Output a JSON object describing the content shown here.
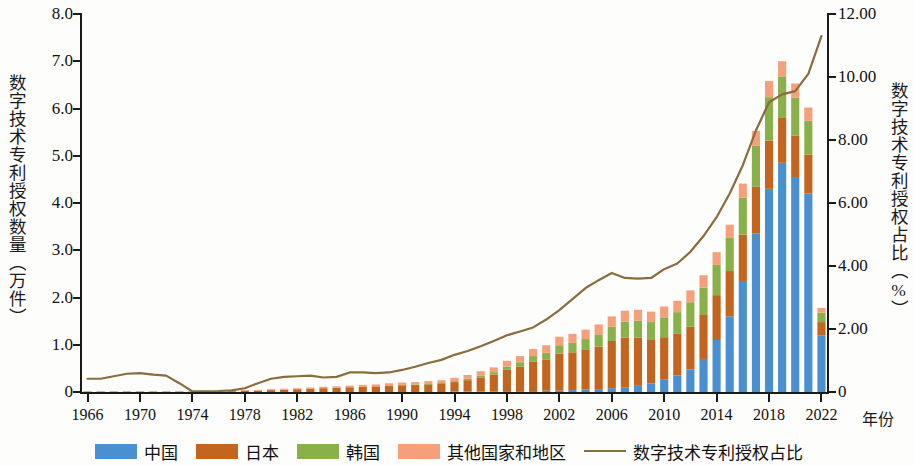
{
  "axes": {
    "y_left_title": "数字技术专利授权数量（万件）",
    "y_right_title": "数字技术专利授权占比（%）",
    "x_title": "年份",
    "y_left_ticks": [
      "8.0",
      "7.0",
      "6.0",
      "5.0",
      "4.0",
      "3.0",
      "2.0",
      "1.0",
      "0"
    ],
    "y_right_ticks": [
      "12.00",
      "10.00",
      "8.00",
      "6.00",
      "4.00",
      "2.00",
      "0"
    ],
    "x_ticks": [
      "1966",
      "1970",
      "1974",
      "1978",
      "1982",
      "1986",
      "1990",
      "1994",
      "1998",
      "2002",
      "2006",
      "2010",
      "2014",
      "2018",
      "2022"
    ]
  },
  "legend": {
    "items": [
      {
        "label": "中国",
        "color": "#4a8fd0",
        "kind": "swatch"
      },
      {
        "label": "日本",
        "color": "#c3651f",
        "kind": "swatch"
      },
      {
        "label": "韩国",
        "color": "#8ab04a",
        "kind": "swatch"
      },
      {
        "label": "其他国家和地区",
        "color": "#f5a07a",
        "kind": "swatch"
      },
      {
        "label": "数字技术专利授权占比",
        "color": "#8a6c3e",
        "kind": "line"
      }
    ]
  },
  "colors": {
    "china": "#4a8fd0",
    "japan": "#c3651f",
    "korea": "#8ab04a",
    "others": "#f5a07a",
    "ratio_line": "#8a6c3e",
    "axis": "#1a1a1a",
    "background": "#fdfdfb"
  },
  "chart_data": {
    "type": "bar",
    "title": "",
    "xlabel": "年份",
    "ylabel": "数字技术专利授权数量（万件）",
    "y2label": "数字技术专利授权占比（%）",
    "ylim": [
      0,
      8.0
    ],
    "y2lim": [
      0,
      12.0
    ],
    "grid": false,
    "legend_position": "bottom",
    "stacked": true,
    "categories": [
      1966,
      1967,
      1968,
      1969,
      1970,
      1971,
      1972,
      1973,
      1974,
      1975,
      1976,
      1977,
      1978,
      1979,
      1980,
      1981,
      1982,
      1983,
      1984,
      1985,
      1986,
      1987,
      1988,
      1989,
      1990,
      1991,
      1992,
      1993,
      1994,
      1995,
      1996,
      1997,
      1998,
      1999,
      2000,
      2001,
      2002,
      2003,
      2004,
      2005,
      2006,
      2007,
      2008,
      2009,
      2010,
      2011,
      2012,
      2013,
      2014,
      2015,
      2016,
      2017,
      2018,
      2019,
      2020,
      2021,
      2022
    ],
    "series": [
      {
        "name": "中国",
        "color": "#4a8fd0",
        "values": [
          0,
          0,
          0,
          0,
          0,
          0,
          0,
          0,
          0,
          0,
          0,
          0,
          0,
          0,
          0,
          0,
          0,
          0,
          0,
          0,
          0,
          0,
          0,
          0,
          0,
          0,
          0,
          0,
          0.01,
          0.01,
          0.01,
          0.01,
          0.02,
          0.02,
          0.02,
          0.03,
          0.03,
          0.04,
          0.05,
          0.06,
          0.08,
          0.1,
          0.13,
          0.18,
          0.26,
          0.35,
          0.48,
          0.7,
          1.1,
          1.6,
          2.35,
          3.35,
          4.3,
          4.85,
          4.55,
          4.2,
          1.2
        ]
      },
      {
        "name": "日本",
        "color": "#c3651f",
        "values": [
          0.01,
          0.01,
          0.01,
          0.01,
          0.01,
          0.01,
          0.01,
          0.01,
          0.01,
          0.02,
          0.02,
          0.02,
          0.03,
          0.03,
          0.04,
          0.05,
          0.06,
          0.07,
          0.08,
          0.09,
          0.1,
          0.11,
          0.12,
          0.13,
          0.14,
          0.15,
          0.16,
          0.17,
          0.2,
          0.24,
          0.3,
          0.36,
          0.45,
          0.52,
          0.62,
          0.66,
          0.78,
          0.8,
          0.84,
          0.9,
          1.0,
          1.05,
          1.02,
          0.92,
          0.9,
          0.88,
          0.9,
          0.93,
          0.95,
          0.96,
          0.98,
          1.0,
          1.02,
          0.95,
          0.88,
          0.82,
          0.28
        ]
      },
      {
        "name": "韩国",
        "color": "#8ab04a",
        "values": [
          0,
          0,
          0,
          0,
          0,
          0,
          0,
          0,
          0,
          0,
          0,
          0,
          0,
          0,
          0,
          0,
          0,
          0,
          0,
          0,
          0,
          0,
          0,
          0.01,
          0.01,
          0.01,
          0.01,
          0.02,
          0.02,
          0.03,
          0.04,
          0.05,
          0.07,
          0.09,
          0.12,
          0.14,
          0.18,
          0.2,
          0.23,
          0.26,
          0.3,
          0.34,
          0.36,
          0.38,
          0.42,
          0.46,
          0.52,
          0.58,
          0.64,
          0.7,
          0.78,
          0.86,
          0.92,
          0.88,
          0.8,
          0.72,
          0.2
        ]
      },
      {
        "name": "其他国家和地区",
        "color": "#f5a07a",
        "values": [
          0.005,
          0.005,
          0.005,
          0.005,
          0.005,
          0.005,
          0.005,
          0.005,
          0.005,
          0.01,
          0.01,
          0.01,
          0.01,
          0.015,
          0.02,
          0.02,
          0.02,
          0.025,
          0.03,
          0.03,
          0.035,
          0.04,
          0.04,
          0.045,
          0.05,
          0.05,
          0.06,
          0.06,
          0.07,
          0.08,
          0.09,
          0.1,
          0.12,
          0.13,
          0.15,
          0.16,
          0.18,
          0.19,
          0.2,
          0.21,
          0.22,
          0.23,
          0.23,
          0.22,
          0.23,
          0.24,
          0.25,
          0.26,
          0.27,
          0.28,
          0.3,
          0.32,
          0.34,
          0.32,
          0.3,
          0.28,
          0.1
        ]
      }
    ],
    "line_series": {
      "name": "数字技术专利授权占比",
      "color": "#8a6c3e",
      "unit": "%",
      "axis": "right",
      "values": [
        0.42,
        0.42,
        0.5,
        0.58,
        0.6,
        0.55,
        0.52,
        0.28,
        0.02,
        0.02,
        0.03,
        0.05,
        0.12,
        0.28,
        0.42,
        0.48,
        0.5,
        0.52,
        0.46,
        0.48,
        0.62,
        0.62,
        0.6,
        0.62,
        0.7,
        0.8,
        0.92,
        1.02,
        1.18,
        1.3,
        1.45,
        1.62,
        1.8,
        1.92,
        2.05,
        2.3,
        2.6,
        2.95,
        3.3,
        3.55,
        3.78,
        3.62,
        3.6,
        3.62,
        3.9,
        4.08,
        4.45,
        4.95,
        5.55,
        6.3,
        7.2,
        8.3,
        9.2,
        9.45,
        9.55,
        10.1,
        11.3
      ]
    }
  }
}
